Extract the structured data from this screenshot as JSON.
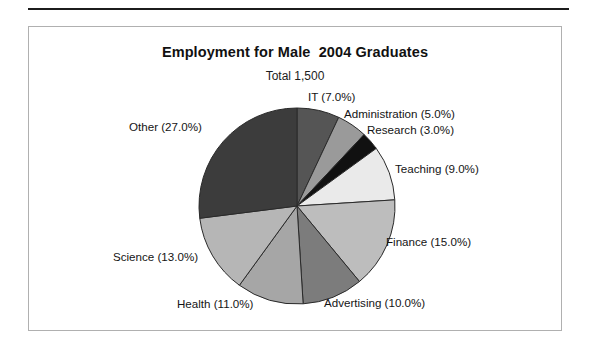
{
  "document": {
    "background_color": "#ffffff",
    "rule_color": "#1c1c1c",
    "frame_color": "#b0b0b0"
  },
  "chart_data": {
    "type": "pie",
    "title": "Employment for Male  2004 Graduates",
    "subtitle": "Total 1,500",
    "total": "1,500",
    "start_angle_deg": 0,
    "direction": "clockwise",
    "legend": "none",
    "labels_position": "outside-callout",
    "categories": [
      "IT",
      "Administration",
      "Research",
      "Teaching",
      "Finance",
      "Advertising",
      "Health",
      "Science",
      "Other"
    ],
    "values": [
      7.0,
      5.0,
      3.0,
      9.0,
      15.0,
      10.0,
      11.0,
      13.0,
      27.0
    ],
    "value_unit": "%",
    "slice_colors": [
      "#555555",
      "#9a9a9a",
      "#111111",
      "#eaeaea",
      "#bdbdbd",
      "#7c7c7c",
      "#a6a6a6",
      "#b6b6b6",
      "#3c3c3c"
    ],
    "slice_label_texts": [
      "IT (7.0%)",
      "Administration (5.0%)",
      "Research (3.0%)",
      "Teaching (9.0%)",
      "Finance (15.0%)",
      "Advertising (10.0%)",
      "Health (11.0%)",
      "Science (13.0%)",
      "Other (27.0%)"
    ],
    "slices": [
      {
        "name": "IT",
        "label": "IT (7.0%)",
        "value": 7.0,
        "color": "#555555"
      },
      {
        "name": "Administration",
        "label": "Administration (5.0%)",
        "value": 5.0,
        "color": "#9a9a9a"
      },
      {
        "name": "Research",
        "label": "Research (3.0%)",
        "value": 3.0,
        "color": "#111111"
      },
      {
        "name": "Teaching",
        "label": "Teaching (9.0%)",
        "value": 9.0,
        "color": "#eaeaea"
      },
      {
        "name": "Finance",
        "label": "Finance (15.0%)",
        "value": 15.0,
        "color": "#bdbdbd"
      },
      {
        "name": "Advertising",
        "label": "Advertising (10.0%)",
        "value": 10.0,
        "color": "#7c7c7c"
      },
      {
        "name": "Health",
        "label": "Health (11.0%)",
        "value": 11.0,
        "color": "#a6a6a6"
      },
      {
        "name": "Science",
        "label": "Science (13.0%)",
        "value": 13.0,
        "color": "#b6b6b6"
      },
      {
        "name": "Other",
        "label": "Other (27.0%)",
        "value": 27.0,
        "color": "#3c3c3c"
      }
    ],
    "xlabel": "",
    "ylabel": "",
    "grid": false
  }
}
